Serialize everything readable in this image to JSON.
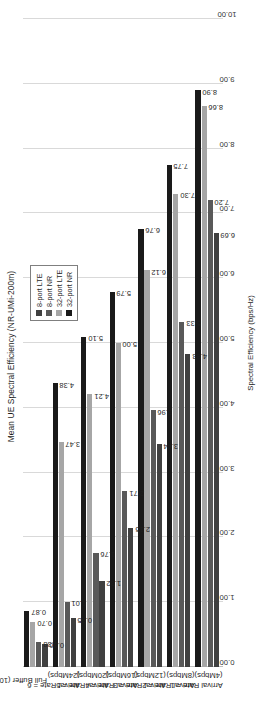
{
  "chart": {
    "title": "Mean UE Spectral Efficiency (NR-UMi-200m)",
    "value_axis_title": "Spectral Efficiency (bps/Hz)"
  },
  "legend": {
    "items": [
      {
        "label": "8-port LTE",
        "color": "#404040"
      },
      {
        "label": "8-port NR",
        "color": "#595959"
      },
      {
        "label": "32-port LTE",
        "color": "#a6a6a6"
      },
      {
        "label": "32-port NR",
        "color": "#1a1a1a"
      }
    ]
  },
  "chart_data": {
    "type": "bar",
    "orientation": "horizontal",
    "title": "Mean UE Spectral Efficiency (NR-UMi-200m)",
    "xlabel": "Spectral Efficiency (bps/Hz)",
    "ylabel": "",
    "xlim": [
      0.0,
      10.0
    ],
    "xticks": [
      "0.00",
      "1.00",
      "2.00",
      "3.00",
      "4.00",
      "5.00",
      "6.00",
      "7.00",
      "8.00",
      "9.00",
      "10.00"
    ],
    "grid": true,
    "legend_position": "upper-right",
    "categories": [
      {
        "line1": "Arrival Rate = 1",
        "line2": "(4Mbps)"
      },
      {
        "line1": "Arrival Rate = 2",
        "line2": "(8Mbps)"
      },
      {
        "line1": "Arrival Rate = 3",
        "line2": "(12Mbps)"
      },
      {
        "line1": "Arrival Rate = 4",
        "line2": "(16Mbps)"
      },
      {
        "line1": "Arrival Rate = 5",
        "line2": "(20Mbps)"
      },
      {
        "line1": "Arrival Rate = 6",
        "line2": "(24Mbps)"
      },
      {
        "line1": "Full Buffer (10 UEs/cell)",
        "line2": ""
      }
    ],
    "series": [
      {
        "name": "8-port LTE",
        "color": "#404040",
        "values": [
          6.69,
          4.83,
          3.44,
          2.15,
          1.32,
          0.75,
          0.36
        ],
        "labels": [
          "6.69",
          "4.83",
          "3.44",
          "2.15",
          "1.32",
          "0.75",
          "0.36"
        ]
      },
      {
        "name": "8-port NR",
        "color": "#595959",
        "values": [
          7.2,
          5.33,
          3.96,
          2.71,
          1.76,
          1.01,
          0.38
        ],
        "labels": [
          "7.20",
          "5.33",
          "3.96",
          "2.71",
          "1.76",
          "1.01",
          "0.38"
        ]
      },
      {
        "name": "32-port LTE",
        "color": "#a6a6a6",
        "values": [
          8.66,
          7.3,
          6.12,
          5.0,
          4.21,
          3.47,
          0.7
        ],
        "labels": [
          "8.66",
          "7.30",
          "6.12",
          "5.00",
          "4.21",
          "3.47",
          "0.70"
        ]
      },
      {
        "name": "32-port NR",
        "color": "#1a1a1a",
        "values": [
          8.9,
          7.75,
          6.76,
          5.79,
          5.1,
          4.38,
          0.87
        ],
        "labels": [
          "8.90",
          "7.75",
          "6.76",
          "5.79",
          "5.10",
          "4.38",
          "0.87"
        ]
      }
    ]
  }
}
